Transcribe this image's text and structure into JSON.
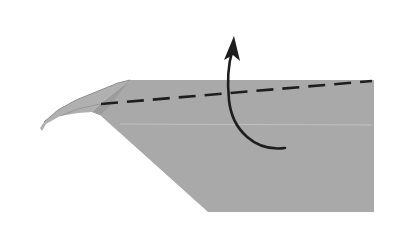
{
  "diagram": {
    "type": "origami-fold-step",
    "colors": {
      "paper": "#a9a9a9",
      "paper_flap": "#b3b3b3",
      "paper_edge_shadow": "#8e8e8e",
      "fold_line": "#1e1e1e",
      "arrow": "#1e1e1e",
      "background": "#ffffff",
      "crease": "#c8c8c8"
    },
    "elements": {
      "fold_line": {
        "style": "dashed",
        "from": [
          101,
          104
        ],
        "to": [
          372,
          81
        ]
      },
      "arrow": {
        "direction": "up",
        "start": [
          285,
          148
        ],
        "tip": [
          233,
          37
        ]
      },
      "crease": {
        "from": [
          120,
          124
        ],
        "to": [
          372,
          125
        ]
      }
    }
  }
}
